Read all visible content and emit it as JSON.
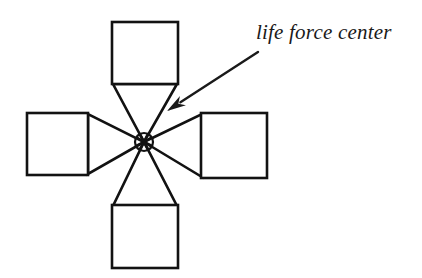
{
  "diagram": {
    "background_color": "#ffffff",
    "stroke_color": "#121212",
    "text_color": "#1a1a1a",
    "annotation": {
      "label": "life force center",
      "x": 256,
      "y": 19,
      "font_size": 21,
      "font_style": "italic"
    },
    "arrow": {
      "name": "pointer-arrow",
      "tail_x": 258,
      "tail_y": 52,
      "tip_x": 167,
      "tip_y": 111,
      "stroke_width": 2.4,
      "head_length": 19,
      "head_width": 11
    },
    "center": {
      "name": "life-force-center-node",
      "cx": 144,
      "cy": 142,
      "radius": 9,
      "stroke_width": 2.6
    },
    "squares": [
      {
        "name": "square-top",
        "label": "top",
        "x": 112,
        "y": 22,
        "width": 66,
        "height": 62
      },
      {
        "name": "square-left",
        "label": "left",
        "x": 27,
        "y": 113,
        "width": 61,
        "height": 62
      },
      {
        "name": "square-right",
        "label": "right",
        "x": 201,
        "y": 113,
        "width": 66,
        "height": 65
      },
      {
        "name": "square-bottom",
        "label": "bottom",
        "x": 112,
        "y": 205,
        "width": 66,
        "height": 63
      }
    ],
    "wedges": [
      {
        "name": "wedge-top",
        "points": "113,84 177,84 144,142"
      },
      {
        "name": "wedge-left",
        "points": "88,114 88,174 144,142"
      },
      {
        "name": "wedge-right",
        "points": "202,114 202,177 144,142"
      },
      {
        "name": "wedge-bottom",
        "points": "113,206 177,206 144,142"
      }
    ],
    "square_stroke_width": 2.6,
    "wedge_stroke_width": 2.6
  }
}
